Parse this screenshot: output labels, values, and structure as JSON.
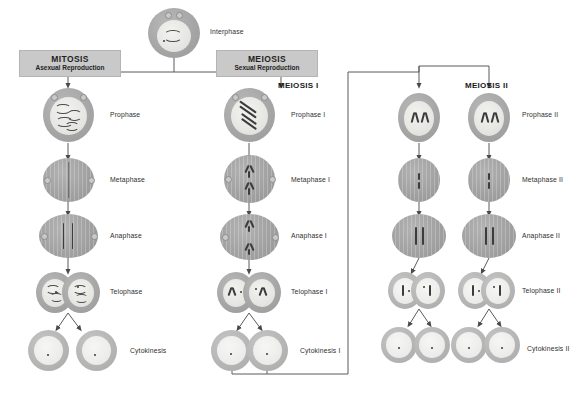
{
  "diagram": {
    "title_alt": "Mitosis and Meiosis comparison chart",
    "background": "#ffffff",
    "line_color": "#555555",
    "header_fill": "#c9c9c9"
  },
  "start": {
    "label": "Interphase"
  },
  "branches": {
    "mitosis": {
      "title": "MITOSIS",
      "subtitle": "Asexual Reproduction"
    },
    "meiosis": {
      "title": "MEIOSIS",
      "subtitle": "Sexual Reproduction"
    }
  },
  "columns": {
    "meiosis_one_title": "MEIOSIS I",
    "meiosis_two_title": "MEIOSIS II"
  },
  "mitosis_stages": [
    {
      "label": "Prophase"
    },
    {
      "label": "Metaphase"
    },
    {
      "label": "Anaphase"
    },
    {
      "label": "Telophase"
    },
    {
      "label": "Cytokinesis"
    }
  ],
  "meiosis_one_stages": [
    {
      "label": "Prophase I"
    },
    {
      "label": "Metaphase I"
    },
    {
      "label": "Anaphase I"
    },
    {
      "label": "Telophase I"
    },
    {
      "label": "Cytokinesis I"
    }
  ],
  "meiosis_two_stages": [
    {
      "label": "Prophase  II"
    },
    {
      "label": "Metaphase II"
    },
    {
      "label": "Anaphase II"
    },
    {
      "label": "Telophase II"
    },
    {
      "label": "Cytokinesis II"
    }
  ]
}
